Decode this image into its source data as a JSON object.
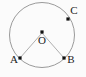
{
  "figure": {
    "name": "circle-with-center-and-three-points",
    "background_color": "#fbfbfb",
    "stroke_color": "#8e8e8e",
    "point_color": "#111111",
    "label_color": "#1a1a1a",
    "circle": {
      "name": "main-circle",
      "center_x": 42,
      "center_y": 35,
      "radius": 32.5
    },
    "points": [
      {
        "id": "O",
        "label": "O",
        "role": "center",
        "x": 42,
        "y": 32,
        "label_x": 42,
        "label_y": 44,
        "label_anchor": "middle"
      },
      {
        "id": "A",
        "label": "A",
        "role": "circumference",
        "x": 20,
        "y": 58,
        "label_x": 14,
        "label_y": 63,
        "label_anchor": "middle"
      },
      {
        "id": "B",
        "label": "B",
        "role": "circumference",
        "x": 64,
        "y": 58,
        "label_x": 71,
        "label_y": 63,
        "label_anchor": "middle"
      },
      {
        "id": "C",
        "label": "C",
        "role": "circumference",
        "x": 68,
        "y": 19,
        "label_x": 74,
        "label_y": 14,
        "label_anchor": "middle"
      }
    ],
    "segments": [
      {
        "id": "OA",
        "name": "radius-oa",
        "from": "O",
        "to": "A",
        "x1": 42,
        "y1": 33,
        "x2": 20,
        "y2": 58
      },
      {
        "id": "OB",
        "name": "radius-ob",
        "from": "O",
        "to": "B",
        "x1": 42,
        "y1": 33,
        "x2": 64,
        "y2": 58
      }
    ]
  }
}
